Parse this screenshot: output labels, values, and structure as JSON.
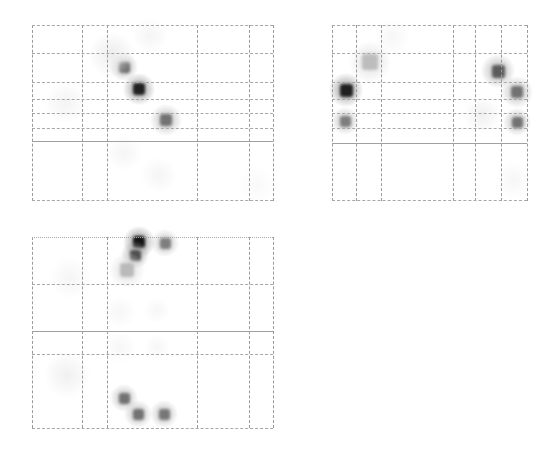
{
  "chart_data": {
    "type": "heatmap",
    "title": "",
    "xlabel": "",
    "ylabel": "",
    "grid": true,
    "legend": null,
    "colormap": "grayscale (white = 0, black = max)",
    "panels": [
      {
        "id": "panel-1",
        "box": {
          "x": 32,
          "y": 25,
          "w": 241,
          "h": 176
        },
        "vlines": [
          0,
          50,
          75,
          165,
          217,
          241
        ],
        "hlines": [
          {
            "y": 0,
            "style": "dashed"
          },
          {
            "y": 28,
            "style": "dashed"
          },
          {
            "y": 57,
            "style": "dashed"
          },
          {
            "y": 74,
            "style": "dashed"
          },
          {
            "y": 88,
            "style": "dashed"
          },
          {
            "y": 103,
            "style": "dashed"
          },
          {
            "y": 116,
            "style": "solid"
          },
          {
            "y": 175,
            "style": "dashed"
          }
        ],
        "spots": [
          {
            "x": 92,
            "y": 42,
            "size": 11,
            "intensity": 0.65
          },
          {
            "x": 107,
            "y": 64,
            "size": 12,
            "intensity": 0.95
          },
          {
            "x": 134,
            "y": 95,
            "size": 12,
            "intensity": 0.6
          },
          {
            "x": 34,
            "y": 78,
            "size": 16,
            "intensity": 0.12
          },
          {
            "x": 80,
            "y": 30,
            "size": 18,
            "intensity": 0.18
          },
          {
            "x": 118,
            "y": 10,
            "size": 14,
            "intensity": 0.1
          },
          {
            "x": 92,
            "y": 128,
            "size": 14,
            "intensity": 0.1
          },
          {
            "x": 127,
            "y": 150,
            "size": 14,
            "intensity": 0.1
          },
          {
            "x": 225,
            "y": 160,
            "size": 14,
            "intensity": 0.06
          }
        ]
      },
      {
        "id": "panel-2",
        "box": {
          "x": 332,
          "y": 25,
          "w": 195,
          "h": 176
        },
        "vlines": [
          0,
          24,
          49,
          121,
          143,
          169,
          195
        ],
        "hlines": [
          {
            "y": 0,
            "style": "dashed"
          },
          {
            "y": 28,
            "style": "dashed"
          },
          {
            "y": 57,
            "style": "dashed"
          },
          {
            "y": 74,
            "style": "dashed"
          },
          {
            "y": 88,
            "style": "dashed"
          },
          {
            "y": 103,
            "style": "dashed"
          },
          {
            "y": 118,
            "style": "solid"
          },
          {
            "y": 175,
            "style": "dashed"
          }
        ],
        "spots": [
          {
            "x": 14,
            "y": 65,
            "size": 13,
            "intensity": 0.95
          },
          {
            "x": 13,
            "y": 96,
            "size": 11,
            "intensity": 0.55
          },
          {
            "x": 38,
            "y": 37,
            "size": 16,
            "intensity": 0.28
          },
          {
            "x": 166,
            "y": 46,
            "size": 13,
            "intensity": 0.7
          },
          {
            "x": 185,
            "y": 67,
            "size": 12,
            "intensity": 0.6
          },
          {
            "x": 185,
            "y": 97,
            "size": 11,
            "intensity": 0.6
          },
          {
            "x": 150,
            "y": 90,
            "size": 14,
            "intensity": 0.15
          },
          {
            "x": 60,
            "y": 12,
            "size": 14,
            "intensity": 0.08
          },
          {
            "x": 182,
            "y": 155,
            "size": 14,
            "intensity": 0.08
          }
        ]
      },
      {
        "id": "panel-3",
        "box": {
          "x": 32,
          "y": 237,
          "w": 241,
          "h": 191
        },
        "vlines": [
          0,
          50,
          75,
          165,
          217,
          241
        ],
        "hlines": [
          {
            "y": 0,
            "style": "dotted"
          },
          {
            "y": 47,
            "style": "dashed"
          },
          {
            "y": 94,
            "style": "solid"
          },
          {
            "y": 117,
            "style": "dashed"
          },
          {
            "y": 191,
            "style": "dashed"
          }
        ],
        "spots": [
          {
            "x": 107,
            "y": 5,
            "size": 12,
            "intensity": 1.0
          },
          {
            "x": 103,
            "y": 18,
            "size": 11,
            "intensity": 0.75
          },
          {
            "x": 133,
            "y": 6,
            "size": 11,
            "intensity": 0.55
          },
          {
            "x": 95,
            "y": 33,
            "size": 14,
            "intensity": 0.3
          },
          {
            "x": 92,
            "y": 161,
            "size": 11,
            "intensity": 0.6
          },
          {
            "x": 106,
            "y": 177,
            "size": 11,
            "intensity": 0.6
          },
          {
            "x": 132,
            "y": 177,
            "size": 11,
            "intensity": 0.58
          },
          {
            "x": 35,
            "y": 138,
            "size": 18,
            "intensity": 0.14
          },
          {
            "x": 38,
            "y": 41,
            "size": 16,
            "intensity": 0.1
          },
          {
            "x": 88,
            "y": 75,
            "size": 12,
            "intensity": 0.08
          },
          {
            "x": 125,
            "y": 73,
            "size": 10,
            "intensity": 0.08
          },
          {
            "x": 88,
            "y": 110,
            "size": 12,
            "intensity": 0.08
          },
          {
            "x": 125,
            "y": 110,
            "size": 10,
            "intensity": 0.08
          }
        ]
      }
    ]
  }
}
